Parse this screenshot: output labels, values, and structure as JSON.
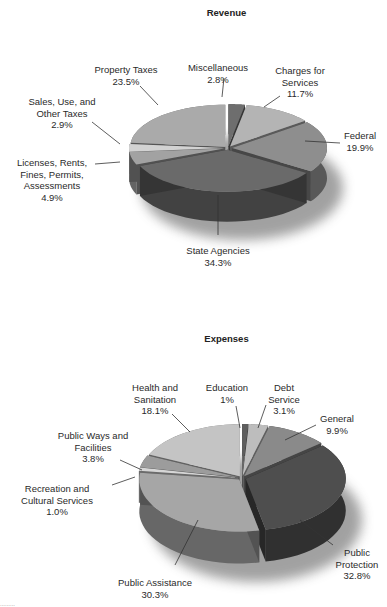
{
  "chart_data": [
    {
      "type": "pie",
      "title": "Revenue",
      "style": "3d-exploded",
      "unit": "%",
      "categories": [
        "Miscellaneous",
        "Charges for Services",
        "Federal",
        "State Agencies",
        "Licenses, Rents, Fines, Permits, Assessments",
        "Sales, Use, and Other Taxes",
        "Property Taxes"
      ],
      "values": [
        2.8,
        11.7,
        19.9,
        34.3,
        4.9,
        2.9,
        23.5
      ],
      "labels": [
        "Miscellaneous\n2.8%",
        "Charges for\nServices\n11.7%",
        "Federal\n19.9%",
        "State Agencies\n34.3%",
        "Licenses, Rents,\nFines, Permits,\nAssessments\n4.9%",
        "Sales, Use, and\nOther Taxes\n2.9%",
        "Property Taxes\n23.5%"
      ],
      "colors": [
        "#6e6e6e",
        "#b4b4b4",
        "#8e8e8e",
        "#6a6a6a",
        "#a2a2a2",
        "#d2d2d2",
        "#aaaaaa"
      ],
      "legend": "none (callout labels)"
    },
    {
      "type": "pie",
      "title": "Expenses",
      "style": "3d-exploded",
      "unit": "%",
      "categories": [
        "Education",
        "Debt Service",
        "General",
        "Public Protection",
        "Public Assistance",
        "Recreation and Cultural Services",
        "Public Ways and Facilities",
        "Health and Sanitation"
      ],
      "values": [
        1.0,
        3.1,
        9.9,
        32.8,
        30.3,
        1.0,
        3.8,
        18.1
      ],
      "labels": [
        "Education\n1%",
        "Debt\nService\n3.1%",
        "General\n9.9%",
        "Public\nProtection\n32.8%",
        "Public Assistance\n30.3%",
        "Recreation and\nCultural Services\n1.0%",
        "Public Ways and\nFacilities\n3.8%",
        "Health and\nSanitation\n18.1%"
      ],
      "colors": [
        "#5e5e5e",
        "#bdbdbd",
        "#8a8a8a",
        "#4e4e4e",
        "#a6a6a6",
        "#d6d6d6",
        "#9c9c9c",
        "#c4c4c4"
      ],
      "legend": "none (callout labels)"
    }
  ],
  "charts": {
    "revenue": {
      "title": "Revenue",
      "labels": [
        {
          "text": "Miscellaneous\n2.8%",
          "x": 218,
          "y": 62
        },
        {
          "text": "Charges for\nServices\n11.7%",
          "x": 300,
          "y": 65
        },
        {
          "text": "Federal\n19.9%",
          "x": 360,
          "y": 130
        },
        {
          "text": "State Agencies\n34.3%",
          "x": 218,
          "y": 245
        },
        {
          "text": "Licenses, Rents,\nFines, Permits,\nAssessments\n4.9%",
          "x": 52,
          "y": 157
        },
        {
          "text": "Sales, Use, and\nOther Taxes\n2.9%",
          "x": 62,
          "y": 96
        },
        {
          "text": "Property Taxes\n23.5%",
          "x": 126,
          "y": 64
        }
      ]
    },
    "expenses": {
      "title": "Expenses",
      "labels": [
        {
          "text": "Education\n1%",
          "x": 227,
          "y": 382
        },
        {
          "text": "Debt\nService\n3.1%",
          "x": 284,
          "y": 382
        },
        {
          "text": "General\n9.9%",
          "x": 337,
          "y": 413
        },
        {
          "text": "Public\nProtection\n32.8%",
          "x": 357,
          "y": 547
        },
        {
          "text": "Public Assistance\n30.3%",
          "x": 155,
          "y": 577
        },
        {
          "text": "Recreation and\nCultural Services\n1.0%",
          "x": 57,
          "y": 483
        },
        {
          "text": "Public Ways and\nFacilities\n3.8%",
          "x": 93,
          "y": 430
        },
        {
          "text": "Health and\nSanitation\n18.1%",
          "x": 155,
          "y": 382
        }
      ]
    }
  },
  "footer_fragment": "........."
}
